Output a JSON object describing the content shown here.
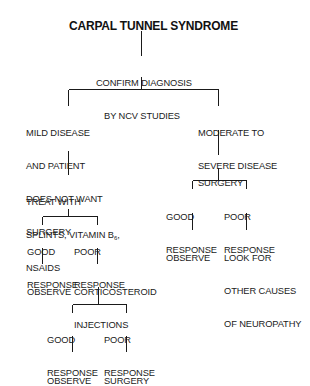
{
  "diagram": {
    "title": "CARPAL TUNNEL SYNDROME",
    "nodes": {
      "confirm": {
        "lines": [
          "CONFIRM DIAGNOSIS",
          "BY NCV STUDIES"
        ]
      },
      "mild": {
        "lines": [
          "MILD DISEASE",
          "AND PATIENT",
          "DOES NOT WANT",
          "SURGERY"
        ]
      },
      "moderate": {
        "lines": [
          "MODERATE TO",
          "SEVERE DISEASE"
        ]
      },
      "treat": {
        "lines": [
          "TREAT WITH",
          "SPLINTS, VITAMIN B",
          "6",
          ",",
          "NSAIDS"
        ]
      },
      "surgery_right": {
        "lines": [
          "SURGERY"
        ]
      },
      "good_response_1": {
        "lines": [
          "GOOD",
          "RESPONSE"
        ]
      },
      "poor_response_1": {
        "lines": [
          "POOR",
          "RESPONSE"
        ]
      },
      "observe_1": {
        "lines": [
          "OBSERVE"
        ]
      },
      "corticosteroid": {
        "lines": [
          "CORTICOSTEROID",
          "INJECTIONS"
        ]
      },
      "good_response_2": {
        "lines": [
          "GOOD",
          "RESPONSE"
        ]
      },
      "poor_response_2": {
        "lines": [
          "POOR",
          "RESPONSE"
        ]
      },
      "observe_2": {
        "lines": [
          "OBSERVE"
        ]
      },
      "surgery_left": {
        "lines": [
          "SURGERY"
        ]
      },
      "good_response_3": {
        "lines": [
          "GOOD",
          "RESPONSE"
        ]
      },
      "poor_response_3": {
        "lines": [
          "POOR",
          "RESPONSE"
        ]
      },
      "observe_3": {
        "lines": [
          "OBSERVE"
        ]
      },
      "look_for": {
        "lines": [
          "LOOK FOR",
          "OTHER CAUSES",
          "OF NEUROPATHY"
        ]
      }
    },
    "edges": [
      [
        "title",
        "confirm"
      ],
      [
        "confirm",
        "mild"
      ],
      [
        "confirm",
        "moderate"
      ],
      [
        "mild",
        "treat"
      ],
      [
        "treat",
        "good_response_1"
      ],
      [
        "treat",
        "poor_response_1"
      ],
      [
        "good_response_1",
        "observe_1"
      ],
      [
        "poor_response_1",
        "corticosteroid"
      ],
      [
        "corticosteroid",
        "good_response_2"
      ],
      [
        "corticosteroid",
        "poor_response_2"
      ],
      [
        "good_response_2",
        "observe_2"
      ],
      [
        "poor_response_2",
        "surgery_left"
      ],
      [
        "moderate",
        "surgery_right"
      ],
      [
        "surgery_right",
        "good_response_3"
      ],
      [
        "surgery_right",
        "poor_response_3"
      ],
      [
        "good_response_3",
        "observe_3"
      ],
      [
        "poor_response_3",
        "look_for"
      ]
    ]
  }
}
